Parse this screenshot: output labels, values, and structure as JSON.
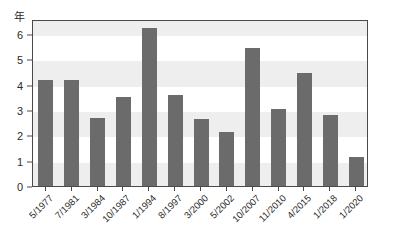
{
  "chart_data": {
    "type": "bar",
    "title": "",
    "xlabel": "",
    "ylabel": "年",
    "ylim": [
      0,
      6.6
    ],
    "yticks": [
      0,
      1,
      2,
      3,
      4,
      5,
      6
    ],
    "ytick_labels": [
      "0",
      "1",
      "2",
      "3",
      "4",
      "5",
      "6"
    ],
    "grid": "alternating-horizontal-bands",
    "legend": "none",
    "bar_color": "#6b6b6b",
    "band_color": "#eeeeee",
    "axis_color": "#4a4a4a",
    "categories": [
      "5/1977",
      "7/1981",
      "3/1984",
      "10/1987",
      "1/1994",
      "8/1997",
      "3/2000",
      "5/2002",
      "10/2007",
      "11/2010",
      "4/2015",
      "1/2018",
      "1/2020"
    ],
    "values": [
      4.2,
      4.2,
      2.7,
      3.5,
      6.25,
      3.6,
      2.65,
      2.15,
      5.45,
      3.05,
      4.45,
      2.8,
      1.15
    ]
  }
}
